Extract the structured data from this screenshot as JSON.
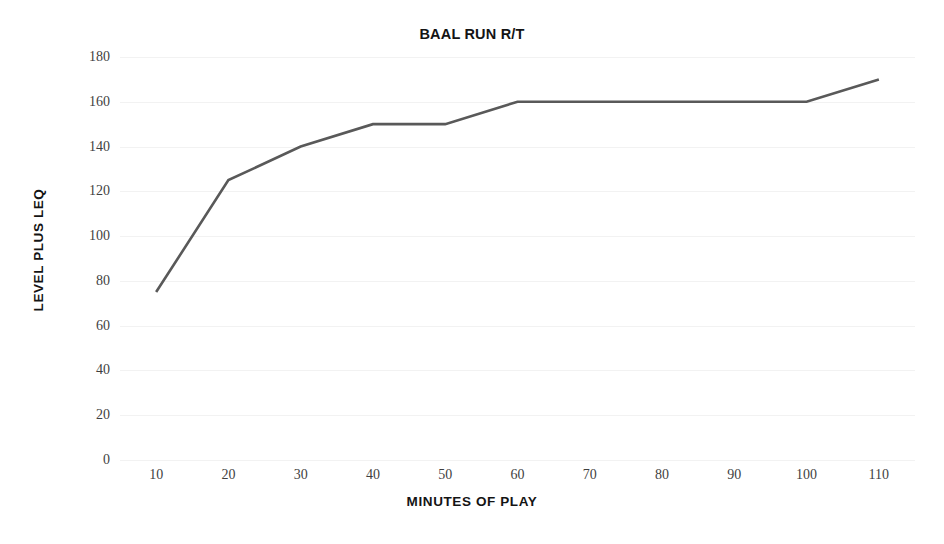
{
  "chart_data": {
    "type": "line",
    "title": "BAAL RUN R/T",
    "xlabel": "MINUTES OF PLAY",
    "ylabel": "LEVEL PLUS LEQ",
    "x": [
      10,
      20,
      30,
      40,
      50,
      60,
      70,
      80,
      90,
      100,
      110
    ],
    "values": [
      75,
      125,
      140,
      150,
      150,
      160,
      160,
      160,
      160,
      160,
      170
    ],
    "series": [
      {
        "name": "BAAL RUN R/T",
        "values": [
          75,
          125,
          140,
          150,
          150,
          160,
          160,
          160,
          160,
          160,
          170
        ]
      }
    ],
    "x_tick_labels": [
      "10",
      "20",
      "30",
      "40",
      "50",
      "60",
      "70",
      "80",
      "90",
      "100",
      "110"
    ],
    "y_tick_labels": [
      "0",
      "20",
      "40",
      "60",
      "80",
      "100",
      "120",
      "140",
      "160",
      "180"
    ],
    "y_ticks": [
      0,
      20,
      40,
      60,
      80,
      100,
      120,
      140,
      160,
      180
    ],
    "xlim": [
      5,
      115
    ],
    "ylim": [
      0,
      180
    ],
    "grid": true,
    "grid_axis": "y",
    "legend": false,
    "legend_position": "none",
    "markers": false,
    "line_color": "#595959",
    "line_width": 2.6,
    "grid_color": "#f2f2f2",
    "background_color": "#ffffff",
    "text_color": "#141414",
    "tick_label_color": "#3f3f3f"
  }
}
